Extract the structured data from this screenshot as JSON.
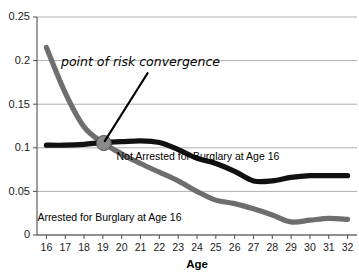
{
  "chart_data": {
    "type": "line",
    "title": "",
    "xlabel": "Age",
    "ylabel": "",
    "x": [
      16,
      17,
      18,
      19,
      20,
      21,
      22,
      23,
      24,
      25,
      26,
      27,
      28,
      29,
      30,
      31,
      32
    ],
    "xlim": [
      15.5,
      32.5
    ],
    "ylim": [
      0,
      0.25
    ],
    "yticks": [
      0,
      0.05,
      0.1,
      0.15,
      0.2,
      0.25
    ],
    "ytick_labels": [
      "0",
      "0.05",
      "0.1",
      "0.15",
      "0.2",
      "0.25"
    ],
    "xtick_labels": [
      "16",
      "17",
      "18",
      "19",
      "20",
      "21",
      "22",
      "23",
      "24",
      "25",
      "26",
      "27",
      "28",
      "29",
      "30",
      "31",
      "32"
    ],
    "grid": true,
    "legend_position": "inline-labels",
    "series": [
      {
        "name": "Arrested for Burglary at Age 16",
        "color": "#6e6e6e",
        "values": [
          0.215,
          0.163,
          0.124,
          0.106,
          0.093,
          0.082,
          0.072,
          0.062,
          0.05,
          0.04,
          0.036,
          0.03,
          0.023,
          0.015,
          0.017,
          0.019,
          0.018
        ]
      },
      {
        "name": "Not Arrested for Burglary at Age 16",
        "color": "#111111",
        "values": [
          0.103,
          0.103,
          0.104,
          0.106,
          0.107,
          0.108,
          0.106,
          0.098,
          0.088,
          0.082,
          0.073,
          0.062,
          0.062,
          0.066,
          0.068,
          0.068,
          0.068
        ]
      }
    ],
    "annotations": [
      {
        "text": "point of risk convergence",
        "text_x": 21.0,
        "text_y": 0.1935,
        "point_x": 19.05,
        "point_y": 0.1055,
        "marker": true,
        "marker_color": "#8a8a8a"
      }
    ],
    "series_labels": [
      {
        "text": "Not Arrested for Burglary at Age 16",
        "x": 24.05,
        "y": 0.0855
      },
      {
        "text": "Arrested for Burglary at Age 16",
        "x": 19.35,
        "y": 0.0165
      }
    ]
  }
}
